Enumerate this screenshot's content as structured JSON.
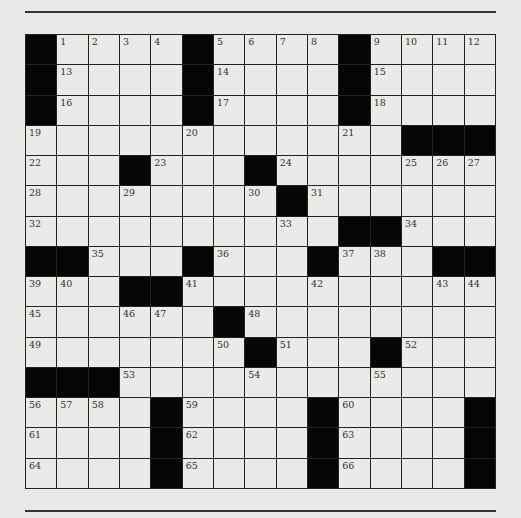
{
  "puzzle": {
    "rows": 15,
    "cols": 15,
    "colors": {
      "black": "#050505",
      "white": "#eaeae8",
      "background": "#e9e9e7",
      "line": "#222222"
    },
    "grid": [
      "#....#....#....",
      "#....#....#....",
      "#....#....#....",
      "............###",
      "...#...#.......",
      "........#......",
      "..........##...",
      "##...#...#...##",
      "...##..........",
      "......#........",
      ".......#...#...",
      "###............",
      "....#....#....#",
      "....#....#....#",
      "....#....#....#"
    ],
    "numbers": [
      {
        "r": 0,
        "c": 1,
        "n": "1"
      },
      {
        "r": 0,
        "c": 2,
        "n": "2"
      },
      {
        "r": 0,
        "c": 3,
        "n": "3"
      },
      {
        "r": 0,
        "c": 4,
        "n": "4"
      },
      {
        "r": 0,
        "c": 6,
        "n": "5"
      },
      {
        "r": 0,
        "c": 7,
        "n": "6"
      },
      {
        "r": 0,
        "c": 8,
        "n": "7"
      },
      {
        "r": 0,
        "c": 9,
        "n": "8"
      },
      {
        "r": 0,
        "c": 11,
        "n": "9"
      },
      {
        "r": 0,
        "c": 12,
        "n": "10"
      },
      {
        "r": 0,
        "c": 13,
        "n": "11"
      },
      {
        "r": 0,
        "c": 14,
        "n": "12"
      },
      {
        "r": 1,
        "c": 1,
        "n": "13"
      },
      {
        "r": 1,
        "c": 6,
        "n": "14"
      },
      {
        "r": 1,
        "c": 11,
        "n": "15"
      },
      {
        "r": 2,
        "c": 1,
        "n": "16"
      },
      {
        "r": 2,
        "c": 6,
        "n": "17"
      },
      {
        "r": 2,
        "c": 11,
        "n": "18"
      },
      {
        "r": 3,
        "c": 0,
        "n": "19"
      },
      {
        "r": 3,
        "c": 5,
        "n": "20"
      },
      {
        "r": 3,
        "c": 10,
        "n": "21"
      },
      {
        "r": 4,
        "c": 0,
        "n": "22"
      },
      {
        "r": 4,
        "c": 4,
        "n": "23"
      },
      {
        "r": 4,
        "c": 8,
        "n": "24"
      },
      {
        "r": 4,
        "c": 12,
        "n": "25"
      },
      {
        "r": 4,
        "c": 13,
        "n": "26"
      },
      {
        "r": 4,
        "c": 14,
        "n": "27"
      },
      {
        "r": 5,
        "c": 0,
        "n": "28"
      },
      {
        "r": 5,
        "c": 3,
        "n": "29"
      },
      {
        "r": 5,
        "c": 7,
        "n": "30"
      },
      {
        "r": 5,
        "c": 9,
        "n": "31"
      },
      {
        "r": 6,
        "c": 0,
        "n": "32"
      },
      {
        "r": 6,
        "c": 8,
        "n": "33"
      },
      {
        "r": 6,
        "c": 12,
        "n": "34"
      },
      {
        "r": 7,
        "c": 2,
        "n": "35"
      },
      {
        "r": 7,
        "c": 6,
        "n": "36"
      },
      {
        "r": 7,
        "c": 10,
        "n": "37"
      },
      {
        "r": 7,
        "c": 11,
        "n": "38"
      },
      {
        "r": 8,
        "c": 0,
        "n": "39"
      },
      {
        "r": 8,
        "c": 1,
        "n": "40"
      },
      {
        "r": 8,
        "c": 5,
        "n": "41"
      },
      {
        "r": 8,
        "c": 9,
        "n": "42"
      },
      {
        "r": 8,
        "c": 13,
        "n": "43"
      },
      {
        "r": 8,
        "c": 14,
        "n": "44"
      },
      {
        "r": 9,
        "c": 0,
        "n": "45"
      },
      {
        "r": 9,
        "c": 3,
        "n": "46"
      },
      {
        "r": 9,
        "c": 4,
        "n": "47"
      },
      {
        "r": 9,
        "c": 7,
        "n": "48"
      },
      {
        "r": 10,
        "c": 0,
        "n": "49"
      },
      {
        "r": 10,
        "c": 6,
        "n": "50"
      },
      {
        "r": 10,
        "c": 8,
        "n": "51"
      },
      {
        "r": 10,
        "c": 12,
        "n": "52"
      },
      {
        "r": 11,
        "c": 3,
        "n": "53"
      },
      {
        "r": 11,
        "c": 7,
        "n": "54"
      },
      {
        "r": 11,
        "c": 11,
        "n": "55"
      },
      {
        "r": 12,
        "c": 0,
        "n": "56"
      },
      {
        "r": 12,
        "c": 1,
        "n": "57"
      },
      {
        "r": 12,
        "c": 2,
        "n": "58"
      },
      {
        "r": 12,
        "c": 5,
        "n": "59"
      },
      {
        "r": 12,
        "c": 10,
        "n": "60"
      },
      {
        "r": 13,
        "c": 0,
        "n": "61"
      },
      {
        "r": 13,
        "c": 5,
        "n": "62"
      },
      {
        "r": 13,
        "c": 10,
        "n": "63"
      },
      {
        "r": 14,
        "c": 0,
        "n": "64"
      },
      {
        "r": 14,
        "c": 5,
        "n": "65"
      },
      {
        "r": 14,
        "c": 10,
        "n": "66"
      }
    ]
  }
}
